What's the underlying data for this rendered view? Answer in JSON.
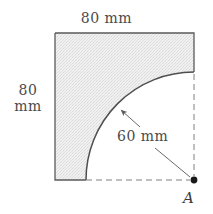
{
  "figure": {
    "colors": {
      "outline": "#555555",
      "fill": "#ededed",
      "stipple": "#d8d8d8",
      "dashed": "#777777",
      "text": "#4a4a4a",
      "point": "#1a1a1a",
      "background": "#ffffff"
    },
    "dimensions": {
      "top_width": "80 mm",
      "left_height_value": "80",
      "left_height_unit": "mm",
      "radius": "60 mm"
    },
    "points": {
      "a_label": "A"
    },
    "geometry": {
      "square_left": 55,
      "square_top": 33,
      "square_right": 194,
      "square_bottom": 180,
      "arc_center_x": 194,
      "arc_center_y": 180,
      "arc_radius": 108,
      "arc_start_x": 194,
      "arc_start_y": 72,
      "arc_end_x": 86,
      "arc_end_y": 180
    }
  }
}
